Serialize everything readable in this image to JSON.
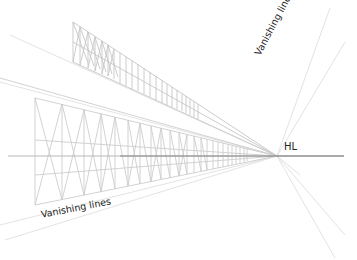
{
  "figure": {
    "labels": {
      "horizon_line": "HL",
      "vanishing_lines_top": "Vanishing lines",
      "vanishing_lines_bottom": "Vanishing lines"
    },
    "vanishing_point": {
      "x": 277,
      "y": 156
    },
    "horizon_line": {
      "y": 156,
      "x_start": 10,
      "x_end": 343
    },
    "colors": {
      "background": "#ffffff",
      "horizon_line": "#555555",
      "structure_lines": "#c8c8c8",
      "vanishing_lines": "#e2e2e2",
      "label_text": "#222222"
    },
    "structures": [
      {
        "name": "upper-truss",
        "left_x": 73,
        "top_y": 22,
        "bottom_y": 62,
        "end_x": 198
      },
      {
        "name": "lower-frame",
        "left_x": 35,
        "top_y": 98,
        "bottom_y": 205,
        "end_x": 248
      }
    ]
  }
}
